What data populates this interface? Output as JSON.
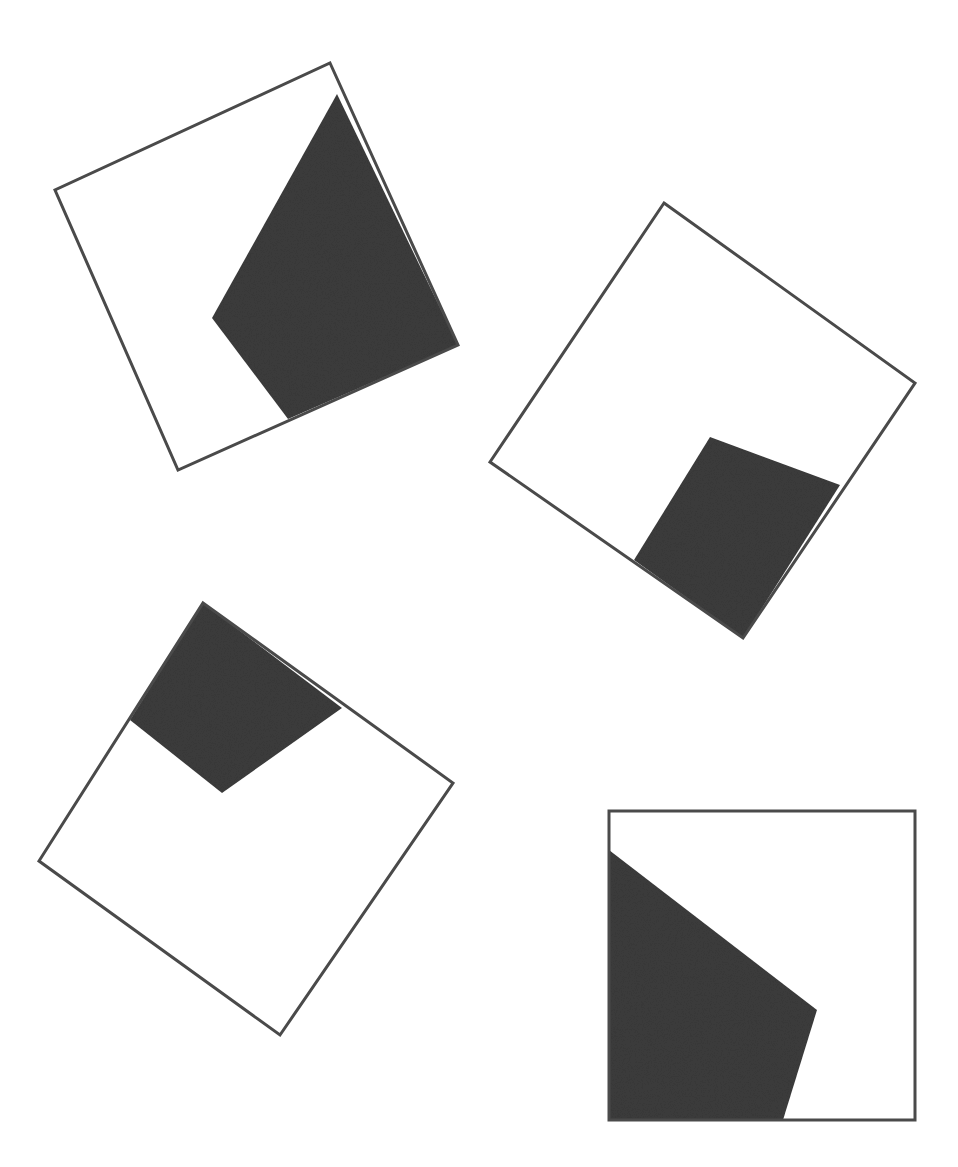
{
  "page": {
    "width": 958,
    "height": 1167,
    "background_color": "#ffffff",
    "header_clipped_text": "",
    "outline_color": "#4a4a4a",
    "shade_color": "#3c3c3c",
    "outline_width": 3
  },
  "figure": {
    "title": "",
    "caption": "",
    "shape_count": 4
  },
  "chart_data": {
    "type": "diagram",
    "title": "",
    "subtitle": "",
    "xlabel": "",
    "ylabel": "",
    "grid": false,
    "legend": "none",
    "units": "pixels",
    "canvas": [
      958,
      1167
    ],
    "shapes": [
      {
        "id": "shape-1",
        "label": "",
        "position": "top-left",
        "rotation_deg": -19,
        "square_vertices": [
          [
            330,
            63
          ],
          [
            458,
            345
          ],
          [
            178,
            470
          ],
          [
            55,
            190
          ]
        ],
        "shaded_vertices": [
          [
            337,
            94
          ],
          [
            458,
            345
          ],
          [
            288,
            419
          ],
          [
            212,
            318
          ]
        ],
        "shaded_fill": "#3c3c3c",
        "stroke": "#4a4a4a"
      },
      {
        "id": "shape-2",
        "label": "",
        "position": "top-right",
        "rotation_deg": -35,
        "square_vertices": [
          [
            664,
            203
          ],
          [
            915,
            383
          ],
          [
            743,
            638
          ],
          [
            490,
            462
          ]
        ],
        "shaded_vertices": [
          [
            710,
            437
          ],
          [
            840,
            485
          ],
          [
            743,
            638
          ],
          [
            634,
            560
          ]
        ],
        "shaded_fill": "#3c3c3c",
        "stroke": "#4a4a4a"
      },
      {
        "id": "shape-3",
        "label": "",
        "position": "bottom-left",
        "rotation_deg": -35,
        "square_vertices": [
          [
            203,
            603
          ],
          [
            453,
            783
          ],
          [
            280,
            1035
          ],
          [
            39,
            861
          ]
        ],
        "shaded_vertices": [
          [
            203,
            603
          ],
          [
            342,
            708
          ],
          [
            222,
            793
          ],
          [
            130,
            720
          ]
        ],
        "shaded_fill": "#3c3c3c",
        "stroke": "#4a4a4a"
      },
      {
        "id": "shape-4",
        "label": "",
        "position": "bottom-right",
        "rotation_deg": 0,
        "square_vertices": [
          [
            609,
            811
          ],
          [
            915,
            811
          ],
          [
            915,
            1120
          ],
          [
            609,
            1120
          ]
        ],
        "shaded_vertices": [
          [
            609,
            850
          ],
          [
            817,
            1010
          ],
          [
            783,
            1120
          ],
          [
            609,
            1120
          ]
        ],
        "shaded_fill": "#3c3c3c",
        "stroke": "#4a4a4a"
      }
    ]
  }
}
